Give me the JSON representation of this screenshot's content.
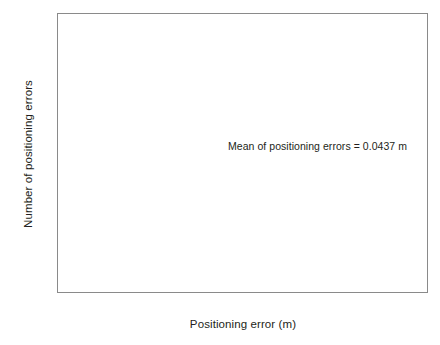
{
  "chart_data": {
    "type": "bar",
    "title": "",
    "subtitle": "",
    "xlabel": "Positioning error (m)",
    "ylabel": "Number of positioning errors",
    "xlim": [
      0,
      0.35
    ],
    "ylim": [
      0,
      1500
    ],
    "grid": false,
    "legend": null,
    "bin_width": 0.00706,
    "annotations": [
      {
        "name": "mean-annotation",
        "text": "Mean of positioning errors = 0.0437 m",
        "x": 0.175,
        "y": 810
      }
    ],
    "xticks": [
      0,
      0.05,
      0.1,
      0.15,
      0.2,
      0.25,
      0.3,
      0.35
    ],
    "xtick_labels": [
      "0",
      "0.05",
      "0.1",
      "0.15",
      "0.2",
      "0.25",
      "0.3",
      "0.35"
    ],
    "yticks": [
      0,
      500,
      1000,
      1500
    ],
    "ytick_labels": [
      "0",
      "500",
      "1000",
      "1500"
    ],
    "bar_color": "#000000",
    "axis_color": "#8a8a8a",
    "categories": [
      0.0035,
      0.0106,
      0.0176,
      0.0247,
      0.0318,
      0.0388,
      0.0459,
      0.0529,
      0.06,
      0.0671,
      0.0741,
      0.0812,
      0.0882,
      0.0953,
      0.1024,
      0.1094,
      0.1165,
      0.1235,
      0.1306,
      0.1377,
      0.1447,
      0.1518,
      0.1588,
      0.1659,
      0.173,
      0.18,
      0.1871,
      0.1941,
      0.2012,
      0.2083,
      0.2153,
      0.2224,
      0.2294,
      0.2365,
      0.2436,
      0.2506,
      0.2577,
      0.2647,
      0.2718,
      0.2789,
      0.2859,
      0.293,
      0.3,
      0.3071,
      0.3142,
      0.3212,
      0.3283,
      0.3353,
      0.3424,
      0.3495
    ],
    "values": [
      375,
      940,
      1285,
      1500,
      1425,
      1355,
      1280,
      1005,
      960,
      840,
      765,
      670,
      590,
      520,
      455,
      390,
      330,
      280,
      245,
      205,
      175,
      150,
      125,
      105,
      88,
      72,
      60,
      48,
      40,
      32,
      26,
      20,
      17,
      14,
      11,
      9,
      12,
      6,
      5,
      4,
      3,
      9,
      2,
      2,
      1,
      1,
      1,
      0,
      0,
      0
    ]
  }
}
